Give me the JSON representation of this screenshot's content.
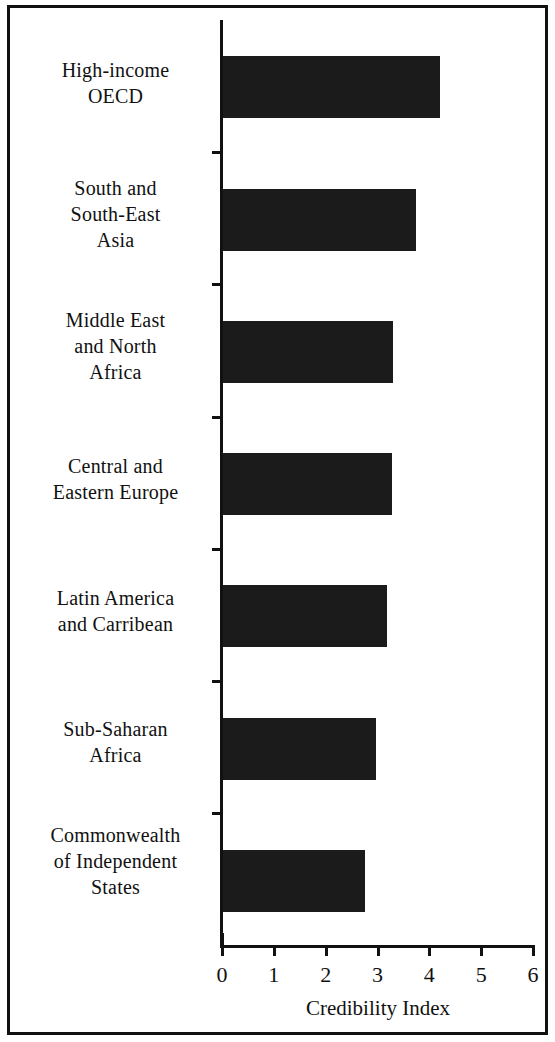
{
  "chart_data": {
    "type": "bar",
    "orientation": "horizontal",
    "title": "",
    "subtitle": "",
    "xlabel": "Credibility Index",
    "ylabel": "",
    "xlim": [
      0,
      6
    ],
    "ylim": null,
    "grid": false,
    "legend": null,
    "legend_position": "none",
    "bar_color": "#1b1b1b",
    "axis_color": "#111111",
    "xticks": [
      0,
      1,
      2,
      3,
      4,
      5,
      6
    ],
    "xtick_labels": [
      "0",
      "1",
      "2",
      "3",
      "4",
      "5",
      "6"
    ],
    "categories": [
      "High-income OECD",
      "South and South-East Asia",
      "Middle East and North Africa",
      "Central and Eastern Europe",
      "Latin America and Carribean",
      "Sub-Saharan Africa",
      "Commonwealth of Independent States"
    ],
    "category_label_lines": [
      [
        "High-income",
        "OECD"
      ],
      [
        "South and",
        "South-East",
        "Asia"
      ],
      [
        "Middle East",
        "and North",
        "Africa"
      ],
      [
        "Central and",
        "Eastern Europe"
      ],
      [
        "Latin America",
        "and Carribean"
      ],
      [
        "Sub-Saharan",
        "Africa"
      ],
      [
        "Commonwealth",
        "of Independent",
        "States"
      ]
    ],
    "values": [
      4.2,
      3.75,
      3.3,
      3.28,
      3.18,
      2.97,
      2.75
    ],
    "annotations": []
  }
}
